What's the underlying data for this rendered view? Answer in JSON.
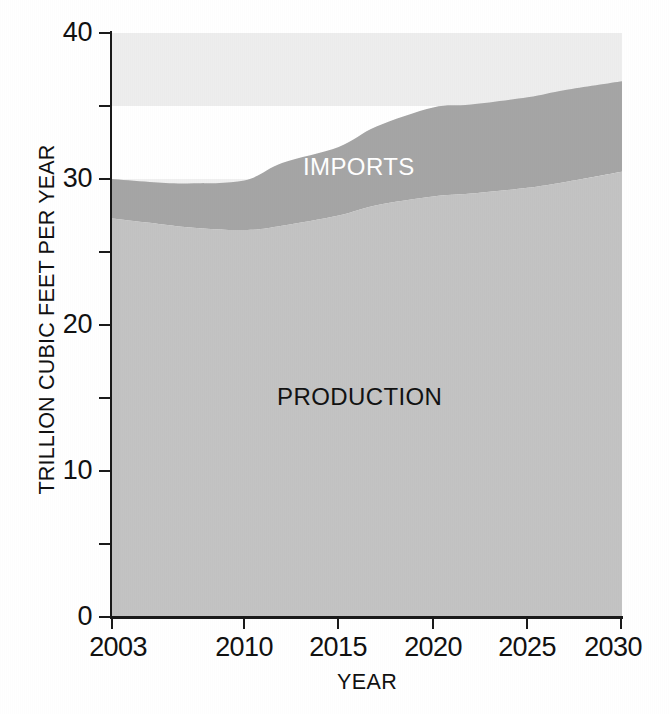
{
  "chart_data": {
    "type": "area",
    "title": "",
    "subtitle": "",
    "xlabel": "YEAR",
    "ylabel": "TRILLION CUBIC FEET PER YEAR",
    "stacked": true,
    "grid": false,
    "legend_position": "inline-annotation",
    "xlim": [
      2003,
      2030
    ],
    "ylim": [
      0,
      40
    ],
    "x_tick_labels": [
      "2003",
      "2010",
      "2015",
      "2020",
      "2025",
      "2030"
    ],
    "x_ticks": [
      2003,
      2010,
      2015,
      2020,
      2025,
      2030
    ],
    "y_tick_labels": [
      "0",
      "10",
      "20",
      "30",
      "40"
    ],
    "y_ticks_major": [
      0,
      10,
      20,
      30,
      40
    ],
    "y_ticks_minor": [
      5,
      15,
      25,
      35
    ],
    "x": [
      2003,
      2005,
      2007,
      2010,
      2012,
      2015,
      2017,
      2020,
      2022,
      2025,
      2027,
      2030
    ],
    "series": [
      {
        "name": "PRODUCTION",
        "color": "#c3c3c3",
        "values": [
          27.3,
          27.0,
          26.7,
          26.5,
          26.8,
          27.5,
          28.2,
          28.8,
          29.0,
          29.4,
          29.8,
          30.5
        ]
      },
      {
        "name": "IMPORTS",
        "color": "#a5a5a5",
        "values": [
          2.7,
          2.8,
          3.0,
          3.4,
          4.3,
          4.7,
          5.4,
          6.1,
          6.1,
          6.2,
          6.3,
          6.2
        ]
      }
    ],
    "cumulative_totals": [
      30.0,
      29.8,
      29.7,
      29.9,
      31.1,
      32.2,
      33.6,
      34.9,
      35.1,
      35.6,
      36.1,
      36.7
    ],
    "annotations": [
      {
        "text": "IMPORTS",
        "x": 2014,
        "y": 31.5,
        "color": "#ffffff"
      },
      {
        "text": "PRODUCTION",
        "x": 2015,
        "y": 15.0,
        "color": "#121212"
      }
    ],
    "background_bands": [
      {
        "from": 35,
        "to": 40,
        "color": "#ededed"
      },
      {
        "from": 0,
        "to": 30,
        "color": "#f0f0f0"
      }
    ]
  },
  "axes": {
    "y_title": "TRILLION CUBIC FEET PER YEAR",
    "x_title": "YEAR",
    "y_labels": [
      "40",
      "30",
      "20",
      "10",
      "0"
    ],
    "x_labels": [
      "2003",
      "2010",
      "2015",
      "2020",
      "2025",
      "2030"
    ]
  },
  "labels": {
    "imports": "IMPORTS",
    "production": "PRODUCTION"
  },
  "colors": {
    "production_fill": "#c3c3c3",
    "imports_fill": "#a5a5a5",
    "band_light": "#ededed",
    "axis": "#1a1a1a",
    "text": "#111111",
    "imports_text": "#ffffff"
  }
}
